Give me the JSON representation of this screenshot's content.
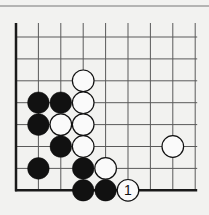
{
  "diagram": {
    "type": "go-board-corner",
    "grid": {
      "columns": 9,
      "rows": 8,
      "origin_x": 16,
      "origin_y": 37,
      "spacing_x": 22.4,
      "spacing_y": 21.9,
      "line_color": "#5a5a5a",
      "edge_color": "#1a1a1a"
    },
    "stones": [
      {
        "color": "white",
        "col": 3,
        "row": 2
      },
      {
        "color": "black",
        "col": 1,
        "row": 3
      },
      {
        "color": "black",
        "col": 2,
        "row": 3
      },
      {
        "color": "white",
        "col": 3,
        "row": 3
      },
      {
        "color": "black",
        "col": 1,
        "row": 4
      },
      {
        "color": "white",
        "col": 2,
        "row": 4
      },
      {
        "color": "white",
        "col": 3,
        "row": 4
      },
      {
        "color": "black",
        "col": 2,
        "row": 5
      },
      {
        "color": "white",
        "col": 3,
        "row": 5
      },
      {
        "color": "white",
        "col": 7,
        "row": 5
      },
      {
        "color": "black",
        "col": 1,
        "row": 6
      },
      {
        "color": "black",
        "col": 3,
        "row": 6
      },
      {
        "color": "white",
        "col": 4,
        "row": 6
      },
      {
        "color": "black",
        "col": 3,
        "row": 7
      },
      {
        "color": "black",
        "col": 4,
        "row": 7
      },
      {
        "color": "white",
        "col": 5,
        "row": 7,
        "label": "1"
      }
    ]
  }
}
